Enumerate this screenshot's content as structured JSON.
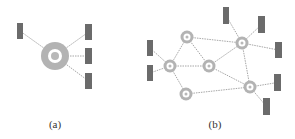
{
  "colors": {
    "node_ring": "#b3b3b3",
    "node_inner": "#ffffff",
    "node_dot": "#b8b8b8",
    "device": "#6b6b6b",
    "edge": "#8f8f8f",
    "label": "#333333"
  },
  "panels": [
    {
      "id": "a",
      "caption": "(a)",
      "caption_pos": [
        55,
        125
      ],
      "hub": {
        "cx": 55,
        "cy": 56,
        "r_outer": 14,
        "r_ring": 7,
        "r_dot": 4
      },
      "devices": [
        {
          "x": 17,
          "y": 23,
          "w": 6,
          "h": 16
        },
        {
          "x": 85,
          "y": 24,
          "w": 7,
          "h": 16
        },
        {
          "x": 85,
          "y": 48,
          "w": 7,
          "h": 16
        },
        {
          "x": 85,
          "y": 73,
          "w": 7,
          "h": 16
        }
      ]
    },
    {
      "id": "b",
      "caption": "(b)",
      "caption_pos": [
        215,
        125
      ],
      "nodes": [
        {
          "id": "A",
          "cx": 187,
          "cy": 37
        },
        {
          "id": "B",
          "cx": 170,
          "cy": 66
        },
        {
          "id": "C",
          "cx": 209,
          "cy": 66
        },
        {
          "id": "D",
          "cx": 186,
          "cy": 94
        },
        {
          "id": "E",
          "cx": 242,
          "cy": 43
        },
        {
          "id": "F",
          "cx": 250,
          "cy": 87
        }
      ],
      "edges": [
        [
          "A",
          "E"
        ],
        [
          "A",
          "B"
        ],
        [
          "A",
          "C"
        ],
        [
          "B",
          "C"
        ],
        [
          "B",
          "D"
        ],
        [
          "C",
          "E"
        ],
        [
          "C",
          "F"
        ],
        [
          "E",
          "F"
        ],
        [
          "D",
          "F"
        ]
      ],
      "devices": [
        {
          "x": 147,
          "y": 40,
          "w": 6,
          "h": 16,
          "node": "B"
        },
        {
          "x": 147,
          "y": 65,
          "w": 6,
          "h": 16,
          "node": "B"
        },
        {
          "x": 223,
          "y": 7,
          "w": 6,
          "h": 17,
          "node": "E"
        },
        {
          "x": 258,
          "y": 16,
          "w": 7,
          "h": 17,
          "node": "E"
        },
        {
          "x": 275,
          "y": 42,
          "w": 7,
          "h": 16,
          "node": "E"
        },
        {
          "x": 274,
          "y": 74,
          "w": 7,
          "h": 17,
          "node": "F"
        },
        {
          "x": 263,
          "y": 98,
          "w": 7,
          "h": 17,
          "node": "F"
        }
      ]
    }
  ]
}
